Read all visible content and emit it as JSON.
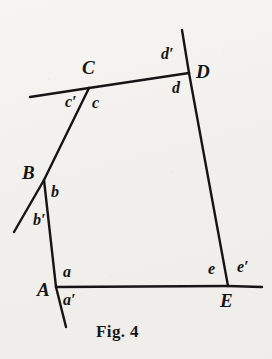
{
  "figure": {
    "caption": "Fig. 4",
    "caption_position": {
      "x": 96,
      "y": 322
    },
    "background_color": "#f2f0ec",
    "ink_color": "#151515",
    "canvas": {
      "width": 272,
      "height": 359
    }
  },
  "vertices": [
    {
      "id": "A",
      "label": "A",
      "x": 56,
      "y": 287,
      "label_x": 37,
      "label_y": 280
    },
    {
      "id": "B",
      "label": "B",
      "x": 44,
      "y": 180,
      "label_x": 22,
      "label_y": 163
    },
    {
      "id": "C",
      "label": "C",
      "x": 89,
      "y": 88,
      "label_x": 82,
      "label_y": 58
    },
    {
      "id": "D",
      "label": "D",
      "x": 189,
      "y": 73,
      "label_x": 196,
      "label_y": 62
    },
    {
      "id": "E",
      "label": "E",
      "x": 228,
      "y": 286,
      "label_x": 220,
      "label_y": 291
    }
  ],
  "polygon_sides": [
    {
      "name": "side-AB",
      "from": "A",
      "to": "B"
    },
    {
      "name": "side-BC",
      "from": "B",
      "to": "C"
    },
    {
      "name": "side-CD",
      "from": "C",
      "to": "D"
    },
    {
      "name": "side-DE",
      "from": "D",
      "to": "E"
    },
    {
      "name": "side-EA",
      "from": "E",
      "to": "A"
    }
  ],
  "extensions": [
    {
      "name": "extension-below-A",
      "from_vertex": "A",
      "to": {
        "x": 66,
        "y": 327
      }
    },
    {
      "name": "extension-below-B",
      "from_vertex": "B",
      "to": {
        "x": 14,
        "y": 232
      }
    },
    {
      "name": "extension-left-of-C",
      "from_vertex": "C",
      "to": {
        "x": 30,
        "y": 97
      }
    },
    {
      "name": "extension-above-D",
      "from_vertex": "D",
      "to": {
        "x": 182,
        "y": 30
      }
    },
    {
      "name": "extension-right-of-E",
      "from_vertex": "E",
      "to": {
        "x": 262,
        "y": 287
      }
    }
  ],
  "angle_labels": [
    {
      "id": "a",
      "text": "a",
      "x": 63,
      "y": 264,
      "at": "A",
      "side": "interior-above"
    },
    {
      "id": "a'",
      "text": "a′",
      "x": 63,
      "y": 292,
      "at": "A",
      "side": "exterior-below"
    },
    {
      "id": "b",
      "text": "b",
      "x": 51,
      "y": 184,
      "at": "B",
      "side": "interior-right"
    },
    {
      "id": "b'",
      "text": "b′",
      "x": 33,
      "y": 212,
      "at": "B",
      "side": "exterior-lower-left"
    },
    {
      "id": "c",
      "text": "c",
      "x": 92,
      "y": 95,
      "at": "C",
      "side": "interior-right"
    },
    {
      "id": "c'",
      "text": "c′",
      "x": 65,
      "y": 94,
      "at": "C",
      "side": "exterior-left"
    },
    {
      "id": "d",
      "text": "d",
      "x": 172,
      "y": 80,
      "at": "D",
      "side": "interior-below"
    },
    {
      "id": "d'",
      "text": "d′",
      "x": 161,
      "y": 46,
      "at": "D",
      "side": "exterior-above"
    },
    {
      "id": "e",
      "text": "e",
      "x": 208,
      "y": 261,
      "at": "E",
      "side": "interior-left"
    },
    {
      "id": "e'",
      "text": "e′",
      "x": 237,
      "y": 259,
      "at": "E",
      "side": "exterior-right"
    }
  ]
}
